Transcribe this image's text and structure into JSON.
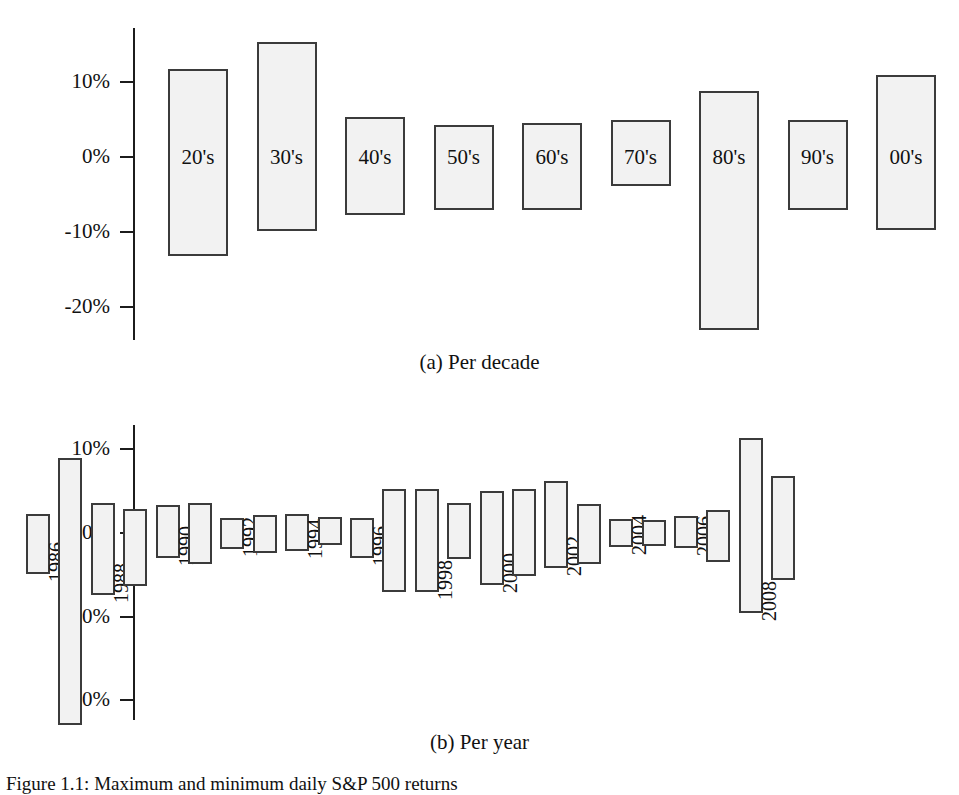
{
  "figure": {
    "caption": "Figure 1.1: Maximum and minimum daily S&P 500 returns"
  },
  "panel_a": {
    "subcaption": "(a)  Per decade"
  },
  "panel_b": {
    "subcaption": "(b)  Per year"
  },
  "chart_data": [
    {
      "type": "bar",
      "id": "per-decade",
      "title": "(a)  Per decade",
      "orientation": "vertical",
      "bar_style": "floating high-low bars",
      "xlabel": "",
      "ylabel": "",
      "ylim": [
        -25,
        17
      ],
      "grid": false,
      "legend": null,
      "ytick_labels": [
        "10%",
        "0%",
        "-10%",
        "-20%"
      ],
      "ytick_values": [
        10,
        0,
        -10,
        -20
      ],
      "categories": [
        "20's",
        "30's",
        "40's",
        "50's",
        "60's",
        "70's",
        "80's",
        "90's",
        "00's"
      ],
      "series": [
        {
          "name": "maximum",
          "values": [
            11.8,
            15.3,
            5.3,
            4.3,
            4.5,
            5.0,
            8.8,
            5.0,
            10.9
          ]
        },
        {
          "name": "minimum",
          "values": [
            -13.2,
            -9.8,
            -7.7,
            -7.0,
            -7.0,
            -3.9,
            -23.0,
            -7.0,
            -9.7
          ]
        }
      ]
    },
    {
      "type": "bar",
      "id": "per-year",
      "title": "(b)  Per year",
      "orientation": "vertical",
      "bar_style": "floating high-low bars",
      "xlabel": "",
      "ylabel": "",
      "ylim": [
        -25,
        13
      ],
      "grid": false,
      "legend": null,
      "ytick_labels": [
        "10%",
        "0%",
        "-10%",
        "-20%"
      ],
      "ytick_values": [
        10,
        0,
        -10,
        -20
      ],
      "categories": [
        "1986",
        "1987",
        "1988",
        "1989",
        "1990",
        "1991",
        "1992",
        "1993",
        "1994",
        "1995",
        "1996",
        "1997",
        "1998",
        "1999",
        "2000",
        "2001",
        "2002",
        "2003",
        "2004",
        "2005",
        "2006",
        "2007",
        "2008",
        "2009"
      ],
      "visible_tick_labels": [
        "1986",
        "1988",
        "1990",
        "1992",
        "1994",
        "1996",
        "1998",
        "2000",
        "2002",
        "2004",
        "2006",
        "2008"
      ],
      "series": [
        {
          "name": "maximum",
          "values": [
            2.3,
            9.0,
            3.6,
            2.9,
            3.3,
            3.6,
            1.8,
            2.1,
            2.3,
            1.9,
            1.8,
            5.2,
            5.2,
            3.6,
            5.0,
            5.2,
            6.2,
            3.5,
            1.7,
            1.5,
            2.0,
            2.8,
            11.3,
            6.8
          ]
        },
        {
          "name": "minimum",
          "values": [
            -4.9,
            -23.0,
            -7.4,
            -6.3,
            -3.0,
            -3.7,
            -1.9,
            -2.4,
            -2.2,
            -1.4,
            -3.0,
            -7.1,
            -7.1,
            -3.1,
            -6.2,
            -5.1,
            -4.2,
            -3.7,
            -1.7,
            -1.5,
            -1.8,
            -3.5,
            -9.5,
            -5.6
          ]
        }
      ]
    }
  ]
}
